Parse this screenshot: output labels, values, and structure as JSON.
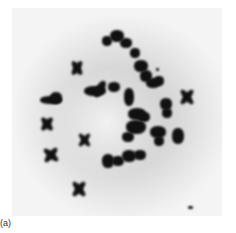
{
  "figure": {
    "label": "(a)"
  }
}
